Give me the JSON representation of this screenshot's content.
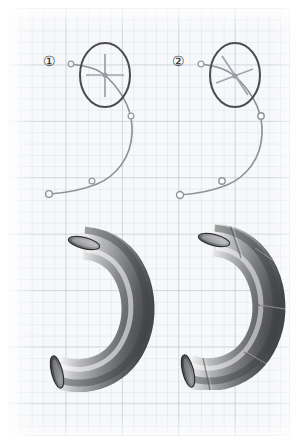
{
  "figure": {
    "panel_count": 2,
    "background": {
      "paper_color": "#f7f8fa",
      "major_grid_color": "#96a3b8",
      "minor_grid_color": "#a5b2c6",
      "major_grid_spacing_px": 56,
      "minor_grid_spacing_px": 11,
      "grid_visible": true,
      "border_color": "#a0acbe"
    },
    "panels": [
      {
        "id": "panel-1",
        "label": "①",
        "label_text": "1",
        "diagram": {
          "type": "spline-with-frame-marker",
          "curve_color": "#8c8f96",
          "curve_points": [
            {
              "name": "start-handle",
              "x": 71,
              "y": 64,
              "marker": "open-circle-small"
            },
            {
              "name": "frame-point",
              "x": 104,
              "y": 74,
              "marker": "cross"
            },
            {
              "name": "mid-upper",
              "x": 130,
              "y": 114,
              "marker": "open-circle-small"
            },
            {
              "name": "mid-lower",
              "x": 90,
              "y": 180,
              "marker": "open-circle-small"
            },
            {
              "name": "end-handle",
              "x": 48,
              "y": 194,
              "marker": "open-circle"
            }
          ],
          "callout_ellipse": {
            "cx": 105,
            "cy": 75,
            "rx": 26,
            "ry": 33,
            "stroke": "#4a4a4a"
          },
          "frame_marker": {
            "kind": "vertical-cross",
            "angle_deg": 0,
            "color": "#9a9da3"
          }
        },
        "render": {
          "type": "swept-tube-3d",
          "appearance": "smooth",
          "seams_visible": false,
          "segment_seam_count": 0,
          "highlight_color": "#f2f2f2",
          "shadow_color": "#4f5053",
          "body_color": "#9b9ca0"
        }
      },
      {
        "id": "panel-2",
        "label": "②",
        "label_text": "2",
        "diagram": {
          "type": "spline-with-frame-marker",
          "curve_color": "#8c8f96",
          "curve_points": [
            {
              "name": "start-handle",
              "x": 201,
              "y": 64,
              "marker": "open-circle-small"
            },
            {
              "name": "frame-point",
              "x": 234,
              "y": 76,
              "marker": "cross"
            },
            {
              "name": "mid-upper",
              "x": 261,
              "y": 115,
              "marker": "open-circle"
            },
            {
              "name": "mid-lower",
              "x": 221,
              "y": 180,
              "marker": "open-circle"
            },
            {
              "name": "end-handle",
              "x": 179,
              "y": 194,
              "marker": "open-circle"
            }
          ],
          "callout_ellipse": {
            "cx": 235,
            "cy": 75,
            "rx": 26,
            "ry": 33,
            "stroke": "#4a4a4a"
          },
          "frame_marker": {
            "kind": "tilted-cross",
            "angle_deg": 38,
            "color": "#9a9da3"
          }
        },
        "render": {
          "type": "swept-tube-3d",
          "appearance": "faceted",
          "seams_visible": true,
          "segment_seam_count": 5,
          "highlight_color": "#f0f0f0",
          "shadow_color": "#4b4c4f",
          "body_color": "#98999d"
        }
      }
    ]
  }
}
